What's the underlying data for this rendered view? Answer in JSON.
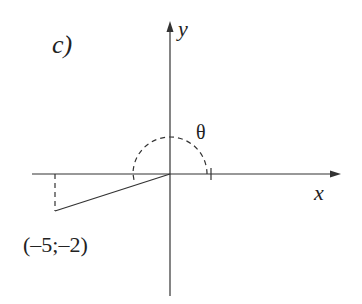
{
  "figure": {
    "part_label": "c)",
    "x_axis_label": "x",
    "y_axis_label": "y",
    "angle_label": "θ",
    "point_label": "(–5;–2)",
    "point": {
      "x": -5,
      "y": -2
    },
    "colors": {
      "stroke": "#333333",
      "background": "#ffffff"
    }
  }
}
